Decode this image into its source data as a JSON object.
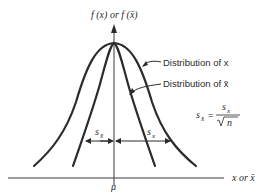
{
  "diagram": {
    "y_axis_label": "f (x) or f (x̄)",
    "x_axis_label": "x or x̄",
    "mean_label": "μ",
    "callouts": [
      {
        "id": "wide",
        "text": "Distribution of x"
      },
      {
        "id": "narrow",
        "text": "Distribution of x̄"
      }
    ],
    "spread_labels": {
      "s_xbar": "s",
      "s_xbar_sub": "x̄",
      "s_x": "s",
      "s_x_sub": "x"
    },
    "formula": {
      "lhs": "s",
      "lhs_sub": "x̄",
      "equals": "=",
      "numerator": "s",
      "numerator_sub": "x",
      "denominator": "n"
    },
    "colors": {
      "ink": "#2b2b2b",
      "background": "#ffffff"
    }
  }
}
